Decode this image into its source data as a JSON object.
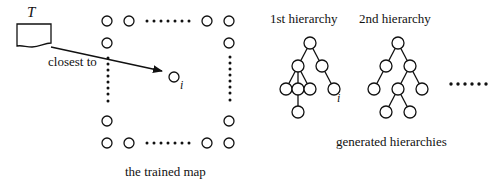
{
  "doc": {
    "label": "T",
    "arrow_label": "closest to"
  },
  "map": {
    "caption": "the trained map",
    "target_node_label": "i"
  },
  "hierarchies": {
    "first_title": "1st hierarchy",
    "second_title": "2nd hierarchy",
    "first_marked_node_label": "i",
    "caption": "generated hierarchies"
  },
  "colors": {
    "stroke": "#111111",
    "background": "#ffffff"
  }
}
